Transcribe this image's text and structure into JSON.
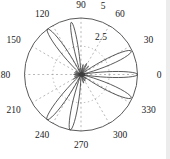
{
  "meta": {
    "background": "#ffffff",
    "page_edge_color": "#ececec"
  },
  "chart_data": {
    "type": "polar-line",
    "title": "",
    "r_max": 5,
    "r_ticks": [
      2.5,
      5
    ],
    "r_tick_labels": [
      "2.5",
      "5"
    ],
    "angle_ticks_deg": [
      0,
      30,
      60,
      90,
      120,
      150,
      180,
      210,
      240,
      270,
      300,
      330
    ],
    "angle_tick_labels": [
      "0",
      "30",
      "60",
      "90",
      "120",
      "150",
      "180",
      "210",
      "240",
      "270",
      "300",
      "330"
    ],
    "grid": {
      "outer_circle": "solid",
      "inner_circle_style": "dotted",
      "spokes_every_deg": 30,
      "legend": "none"
    },
    "colors": {
      "curve": "#3c3c3c",
      "grid": "#9a9a9a",
      "outer_circle": "#5a5a5a",
      "text": "#1a1a1a"
    },
    "lobes_main": [
      {
        "angle_deg": 0,
        "peak_r": 5.0,
        "half_width_deg": 10
      },
      {
        "angle_deg": 25,
        "peak_r": 4.9,
        "half_width_deg": 12
      },
      {
        "angle_deg": 100.5,
        "peak_r": 4.7,
        "half_width_deg": 8
      },
      {
        "angle_deg": 126.5,
        "peak_r": 5.0,
        "half_width_deg": 11
      },
      {
        "angle_deg": 233,
        "peak_r": 5.0,
        "half_width_deg": 11
      },
      {
        "angle_deg": 259,
        "peak_r": 5.0,
        "half_width_deg": 10
      },
      {
        "angle_deg": 335,
        "peak_r": 4.9,
        "half_width_deg": 12
      }
    ],
    "lobes_minor": [
      {
        "angle_deg": 48,
        "peak_r": 1.0,
        "half_width_deg": 6
      },
      {
        "angle_deg": 63,
        "peak_r": 1.1,
        "half_width_deg": 6
      },
      {
        "angle_deg": 78,
        "peak_r": 0.9,
        "half_width_deg": 6
      },
      {
        "angle_deg": 150,
        "peak_r": 0.55,
        "half_width_deg": 6
      },
      {
        "angle_deg": 165,
        "peak_r": 0.6,
        "half_width_deg": 6
      },
      {
        "angle_deg": 180,
        "peak_r": 0.65,
        "half_width_deg": 6
      },
      {
        "angle_deg": 196,
        "peak_r": 0.6,
        "half_width_deg": 6
      },
      {
        "angle_deg": 211,
        "peak_r": 0.8,
        "half_width_deg": 6
      },
      {
        "angle_deg": 287,
        "peak_r": 0.8,
        "half_width_deg": 6
      },
      {
        "angle_deg": 302,
        "peak_r": 0.7,
        "half_width_deg": 6
      },
      {
        "angle_deg": 317,
        "peak_r": 0.6,
        "half_width_deg": 6
      }
    ]
  }
}
